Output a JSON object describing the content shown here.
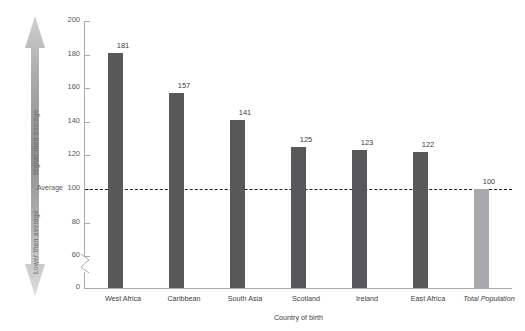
{
  "chart_data": {
    "type": "bar",
    "title": "",
    "subtitle": "",
    "xlabel": "Country of birth",
    "ylabel": "",
    "categories": [
      "West Africa",
      "Caribbean",
      "South Asia",
      "Scotland",
      "Ireland",
      "East Africa",
      "Total Population"
    ],
    "values": [
      181,
      157,
      141,
      125,
      123,
      122,
      100
    ],
    "value_labels": [
      "181",
      "157",
      "141",
      "125",
      "123",
      "122",
      "100"
    ],
    "ylim": [
      0,
      200
    ],
    "yticks": [
      0,
      60,
      80,
      100,
      120,
      140,
      160,
      180,
      200
    ],
    "ytick_labels": [
      "0",
      "60",
      "80",
      "100",
      "120",
      "140",
      "160",
      "180",
      "200"
    ],
    "axis_break": true,
    "axis_break_between": [
      0,
      60
    ],
    "grid": false,
    "legend": "none",
    "reference_line": {
      "value": 100,
      "style": "dashed",
      "label": "Average"
    },
    "annotations": {
      "arrow_top_label": "Higher than average",
      "arrow_bottom_label": "Lower than average",
      "average_label": "Average"
    },
    "series": [
      {
        "name": "Rate relative to average",
        "values": [
          181,
          157,
          141,
          125,
          123,
          122,
          100
        ]
      }
    ],
    "bar_colors": [
      "#58585a",
      "#58585a",
      "#58585a",
      "#58585a",
      "#58585a",
      "#58585a",
      "#a7a9ac"
    ],
    "emphasis_category": "Total Population"
  },
  "colors": {
    "bar": "#58585a",
    "bar_total": "#a7a9ac",
    "axis": "#a7a9ac",
    "text": "#414042",
    "reference_line": "#231f20",
    "arrow_light": "#d9dadb",
    "arrow_dark": "#9b9c9e",
    "background": "#ffffff"
  }
}
